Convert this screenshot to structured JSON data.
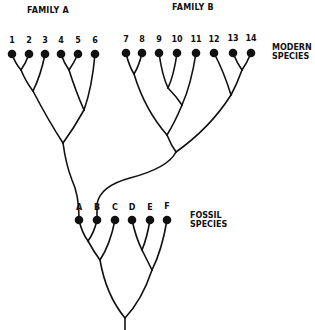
{
  "labels": {
    "family_a": "FAMILY A",
    "family_b": "FAMILY B",
    "modern_line1": "MODERN",
    "modern_line2": "SPECIES",
    "fossil_line1": "FOSSIL",
    "fossil_line2": "SPECIES"
  },
  "modern_species": [
    {
      "id": "1",
      "x": 12,
      "y": 54
    },
    {
      "id": "2",
      "x": 29,
      "y": 54
    },
    {
      "id": "3",
      "x": 45,
      "y": 54
    },
    {
      "id": "4",
      "x": 61,
      "y": 54
    },
    {
      "id": "5",
      "x": 78,
      "y": 54
    },
    {
      "id": "6",
      "x": 95,
      "y": 54
    },
    {
      "id": "7",
      "x": 126,
      "y": 53
    },
    {
      "id": "8",
      "x": 142,
      "y": 53
    },
    {
      "id": "9",
      "x": 159,
      "y": 53
    },
    {
      "id": "10",
      "x": 177,
      "y": 53
    },
    {
      "id": "11",
      "x": 196,
      "y": 53
    },
    {
      "id": "12",
      "x": 214,
      "y": 53
    },
    {
      "id": "13",
      "x": 233,
      "y": 53
    },
    {
      "id": "14",
      "x": 251,
      "y": 53
    }
  ],
  "fossil_species": [
    {
      "id": "A",
      "x": 79,
      "y": 220
    },
    {
      "id": "B",
      "x": 97,
      "y": 220
    },
    {
      "id": "C",
      "x": 115,
      "y": 220
    },
    {
      "id": "D",
      "x": 132,
      "y": 220
    },
    {
      "id": "E",
      "x": 150,
      "y": 220
    },
    {
      "id": "F",
      "x": 167,
      "y": 220
    }
  ],
  "relationships": {
    "family_a_ancestor": "A",
    "family_b_ancestor": "B"
  }
}
